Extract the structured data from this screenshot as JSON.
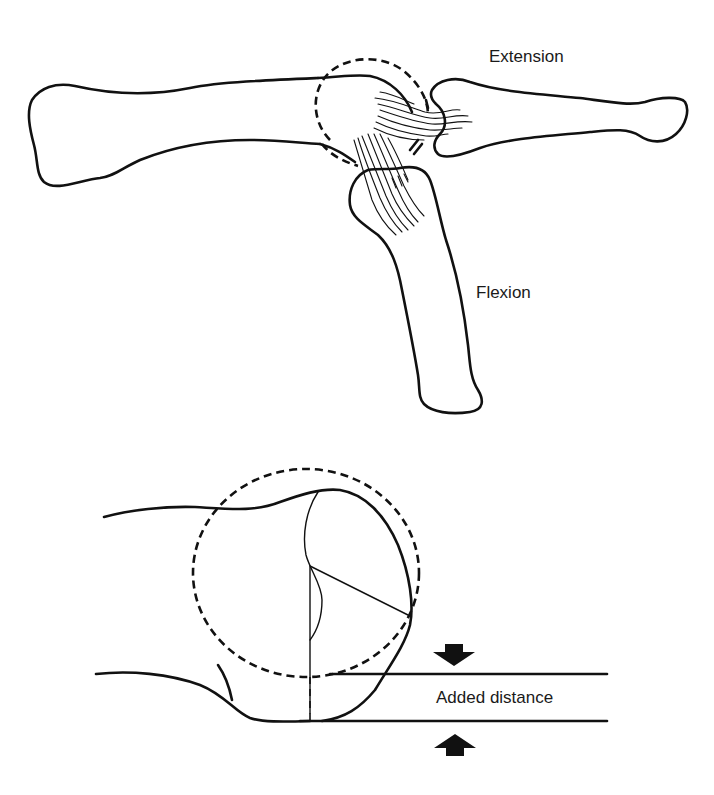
{
  "figure": {
    "top_panel": {
      "labels": {
        "extension": "Extension",
        "flexion": "Flexion"
      }
    },
    "bottom_panel": {
      "labels": {
        "added_distance": "Added distance"
      },
      "arrows": [
        "arrow-down",
        "arrow-up"
      ]
    },
    "colors": {
      "ink": "#111111",
      "background": "#ffffff"
    }
  }
}
